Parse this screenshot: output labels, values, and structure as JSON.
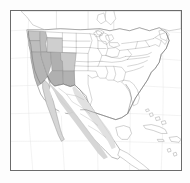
{
  "figure": {
    "type": "range-distribution-map",
    "title": "",
    "region": "North America",
    "background_color": "#ffffff",
    "frame_color": "#6b6b6b",
    "projection_note": "",
    "graticule_visible": true
  },
  "legend": {
    "visible": false,
    "entries": [
      {
        "label": "Core range (shaded)",
        "color": "#b9b9b9"
      },
      {
        "label": "Peripheral range (light shade)",
        "color": "#d8d8d8"
      },
      {
        "label": "Outside range",
        "color": "#ffffff"
      }
    ]
  },
  "colors": {
    "core_shade": "#b5b5b5",
    "mid_shade": "#c7c7c7",
    "light_shade": "#d9d9d9",
    "very_light_shade": "#e4e4e4",
    "outline": "#8a8a8a",
    "coastline": "#707070",
    "border_state": "#9a9a9a",
    "frame": "#6b6b6b",
    "water": "#ffffff",
    "page": "#ffffff"
  },
  "shaded_regions": [
    {
      "name": "Washington",
      "shade": "#c4c4c4"
    },
    {
      "name": "Oregon",
      "shade": "#bdbdbd"
    },
    {
      "name": "Idaho",
      "shade": "#bdbdbd"
    },
    {
      "name": "California",
      "shade": "#b5b5b5"
    },
    {
      "name": "Nevada",
      "shade": "#b5b5b5"
    },
    {
      "name": "Utah",
      "shade": "#b0b0b0"
    },
    {
      "name": "Arizona",
      "shade": "#b0b0b0"
    },
    {
      "name": "New Mexico",
      "shade": "#b2b2b2"
    },
    {
      "name": "Colorado",
      "shade": "#c9c9c9"
    },
    {
      "name": "Wyoming",
      "shade": "#cfcfcf"
    },
    {
      "name": "Baja California",
      "shade": "#d6d6d6"
    },
    {
      "name": "Sierra Madre Occidental",
      "shade": "#d2d2d2"
    },
    {
      "name": "Sierra Madre Oriental",
      "shade": "#dcdcdc"
    }
  ],
  "unshaded_regions": [
    "Montana",
    "North Dakota",
    "South Dakota",
    "Nebraska",
    "Kansas",
    "Oklahoma",
    "Texas",
    "Minnesota",
    "Iowa",
    "Missouri",
    "Arkansas",
    "Louisiana",
    "Wisconsin",
    "Illinois",
    "Michigan",
    "Indiana",
    "Ohio",
    "Kentucky",
    "Tennessee",
    "Mississippi",
    "Alabama",
    "Georgia",
    "Florida",
    "South Carolina",
    "North Carolina",
    "Virginia",
    "West Virginia",
    "Pennsylvania",
    "New York",
    "New England",
    "Canada",
    "Cuba",
    "Bahamas"
  ],
  "water_bodies": [
    "Pacific Ocean",
    "Atlantic Ocean",
    "Gulf of Mexico",
    "Great Lakes",
    "Gulf of California",
    "Caribbean Sea",
    "Hudson Bay"
  ],
  "annotations": []
}
